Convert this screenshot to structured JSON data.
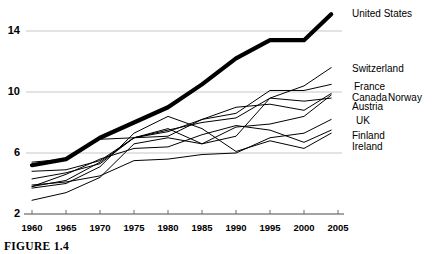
{
  "figure": {
    "caption": "FIGURE 1.4"
  },
  "chart_data": {
    "type": "line",
    "title": "",
    "subtitle": "",
    "xlabel": "",
    "ylabel": "",
    "xlim": [
      1960,
      2005
    ],
    "ylim": [
      2,
      15.6
    ],
    "grid": true,
    "grid_axis": "y",
    "legend_position": "right-inline",
    "x": [
      1960,
      1965,
      1970,
      1975,
      1980,
      1985,
      1990,
      1995,
      2000,
      2004
    ],
    "xticks": [
      "1960",
      "1965",
      "1970",
      "1975",
      "1980",
      "1985",
      "1990",
      "1995",
      "2000",
      "2005"
    ],
    "yticks": [
      "2",
      "6",
      "10",
      "14"
    ],
    "ytick_values": [
      2,
      6,
      10,
      14
    ],
    "series": [
      {
        "name": "United States",
        "emphasis": "bold",
        "values": [
          5.2,
          5.6,
          7.0,
          8.0,
          9.0,
          10.5,
          12.2,
          13.4,
          13.4,
          15.1
        ]
      },
      {
        "name": "Switzerland",
        "emphasis": "normal",
        "values": [
          4.8,
          4.9,
          5.5,
          7.0,
          7.5,
          8.0,
          8.3,
          9.6,
          10.4,
          11.6
        ]
      },
      {
        "name": "France",
        "emphasis": "normal",
        "values": [
          3.8,
          4.2,
          5.4,
          7.0,
          7.4,
          8.2,
          8.6,
          10.1,
          10.1,
          10.5
        ]
      },
      {
        "name": "Canada",
        "emphasis": "normal",
        "values": [
          5.4,
          5.6,
          6.9,
          7.0,
          7.1,
          8.2,
          9.0,
          9.2,
          8.8,
          9.9
        ]
      },
      {
        "name": "Norway",
        "emphasis": "normal",
        "values": [
          2.9,
          3.4,
          4.4,
          6.6,
          7.0,
          6.6,
          7.7,
          7.9,
          8.4,
          9.8
        ]
      },
      {
        "name": "Austria",
        "emphasis": "normal",
        "values": [
          4.3,
          4.7,
          5.3,
          7.0,
          7.6,
          6.6,
          7.1,
          9.6,
          9.4,
          9.6
        ]
      },
      {
        "name": "UK",
        "emphasis": "normal",
        "values": [
          3.9,
          4.1,
          4.5,
          5.5,
          5.6,
          5.9,
          6.0,
          7.0,
          7.3,
          8.2
        ]
      },
      {
        "name": "Finland",
        "emphasis": "normal",
        "values": [
          3.8,
          4.6,
          5.6,
          6.3,
          6.4,
          7.2,
          7.8,
          7.5,
          6.7,
          7.5
        ]
      },
      {
        "name": "Ireland",
        "emphasis": "normal",
        "values": [
          3.7,
          4.0,
          5.1,
          7.3,
          8.4,
          7.6,
          6.1,
          6.8,
          6.3,
          7.3
        ]
      }
    ],
    "annotations": [
      {
        "label": "United States",
        "y_value": 15.1
      },
      {
        "label": "Switzerland",
        "y_value": 11.6
      },
      {
        "label": "France",
        "y_value": 10.5
      },
      {
        "label": "Canada",
        "y_value": 9.95
      },
      {
        "label": "Norway",
        "y_value": 9.95
      },
      {
        "label": "Austria",
        "y_value": 9.4
      },
      {
        "label": "UK",
        "y_value": 8.2
      },
      {
        "label": "Finland",
        "y_value": 7.5
      },
      {
        "label": "Ireland",
        "y_value": 7.0
      }
    ]
  }
}
